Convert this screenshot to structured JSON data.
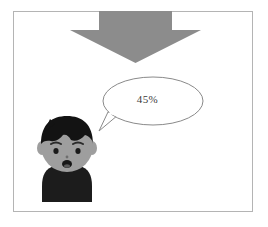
{
  "scene": {
    "title": "Cartoon boy with speech bubble and down arrow",
    "background_color": "#ffffff",
    "frame": {
      "name": "picture-frame",
      "border_color": "#b4b4b4"
    }
  },
  "arrow": {
    "label": "down-arrow",
    "direction": "down",
    "fill_color": "#8c8c8c"
  },
  "speech_bubble": {
    "label": "speech-bubble",
    "text": "45%",
    "outline_color": "#8a8a8a",
    "fill_color": "#ffffff",
    "tail_direction": "down-left"
  },
  "character": {
    "label": "cartoon-boy",
    "hair_color": "#131313",
    "skin_color": "#9e9e9e",
    "shirt_color": "#1c1c1c",
    "eye_color": "#1a1a1a",
    "mouth_color": "#171717",
    "expression": "surprised"
  }
}
